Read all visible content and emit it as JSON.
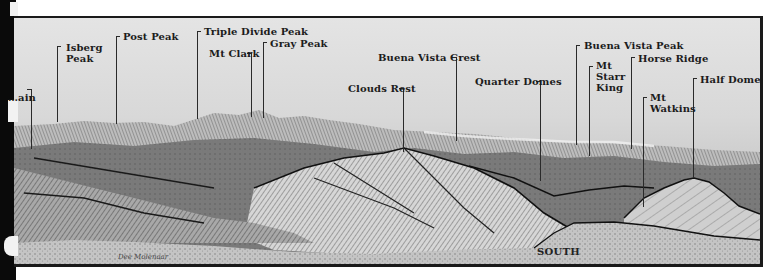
{
  "illustration": {
    "type": "panoramic mountain sketch",
    "direction_label": "SOUTH",
    "signature": "Dee Molenaar",
    "labels": [
      {
        "id": "mountain-partial",
        "text": "…ain",
        "x": 8,
        "y": 92
      },
      {
        "id": "isberg-peak",
        "text": "Isberg\nPeak",
        "x": 66,
        "y": 42
      },
      {
        "id": "post-peak",
        "text": "Post Peak",
        "x": 123,
        "y": 32
      },
      {
        "id": "triple-divide-peak",
        "text": "Triple Divide Peak",
        "x": 204,
        "y": 27
      },
      {
        "id": "mt-clark",
        "text": "Mt Clark",
        "x": 210,
        "y": 49
      },
      {
        "id": "gray-peak",
        "text": "Gray Peak",
        "x": 270,
        "y": 38
      },
      {
        "id": "buena-vista-crest",
        "text": "Buena Vista Crest",
        "x": 378,
        "y": 53
      },
      {
        "id": "clouds-rest",
        "text": "Clouds Rest",
        "x": 349,
        "y": 84
      },
      {
        "id": "quarter-domes",
        "text": "Quarter Domes",
        "x": 475,
        "y": 77
      },
      {
        "id": "buena-vista-peak",
        "text": "Buena Vista Peak",
        "x": 585,
        "y": 40
      },
      {
        "id": "mt-starr-king",
        "text": "Mt\nStarr\nKing",
        "x": 598,
        "y": 60
      },
      {
        "id": "horse-ridge",
        "text": "Horse Ridge",
        "x": 638,
        "y": 53
      },
      {
        "id": "mt-watkins",
        "text": "Mt\nWatkins",
        "x": 650,
        "y": 92
      },
      {
        "id": "half-dome",
        "text": "Half Dome",
        "x": 697,
        "y": 74
      }
    ]
  },
  "colors": {
    "sky": "#d8d8d8",
    "ink": "#1c1c1c",
    "frame": "#1a1a1a"
  }
}
